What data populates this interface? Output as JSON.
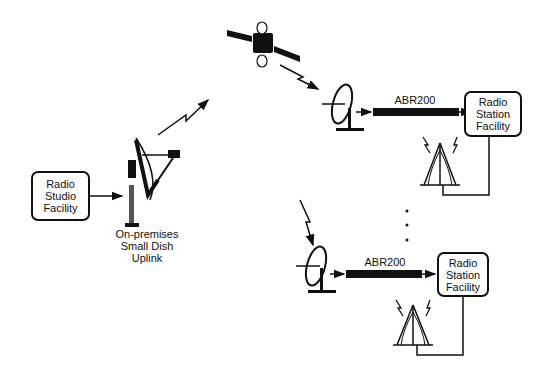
{
  "diagram": {
    "studio": {
      "lines": [
        "Radio",
        "Studio",
        "Facility"
      ]
    },
    "uplink": {
      "lines": [
        "On-premises",
        "Small Dish",
        "Uplink"
      ]
    },
    "receiver_top": {
      "device_label": "ABR200",
      "station_lines": [
        "Radio",
        "Station",
        "Facility"
      ]
    },
    "receiver_bottom": {
      "device_label": "ABR200",
      "station_lines": [
        "Radio",
        "Station",
        "Facility"
      ]
    },
    "ellipsis": "· · ·"
  }
}
